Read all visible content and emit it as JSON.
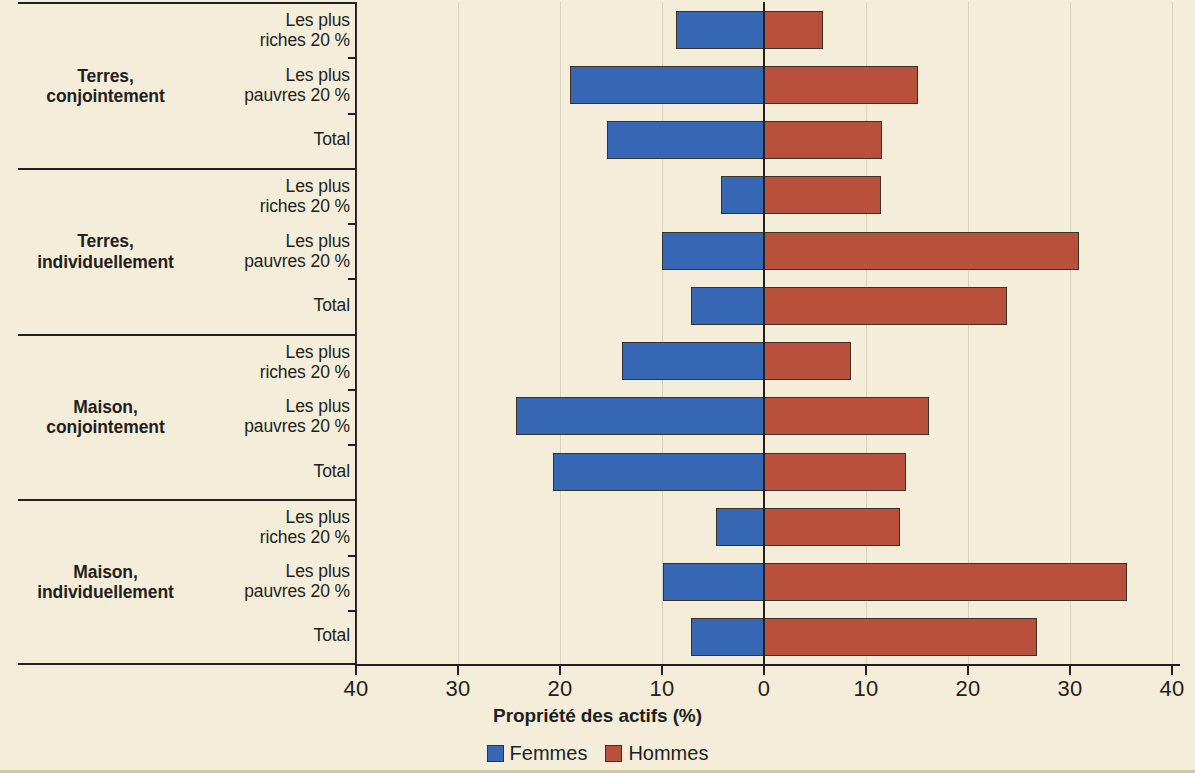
{
  "colors": {
    "female": "#3667b5",
    "male": "#b8503c",
    "background": "#f4edda",
    "ink": "#231f20"
  },
  "axis": {
    "title": "Propriété des actifs (%)",
    "tick_labels": [
      "40",
      "30",
      "20",
      "10",
      "0",
      "10",
      "20",
      "30",
      "40"
    ],
    "tick_values": [
      -40,
      -30,
      -20,
      -10,
      0,
      10,
      20,
      30,
      40
    ]
  },
  "legend": {
    "items": [
      {
        "label": "Femmes",
        "color": "#3667b5"
      },
      {
        "label": "Hommes",
        "color": "#b8503c"
      }
    ]
  },
  "groups": [
    {
      "title_line1": "Terres,",
      "title_line2": "conjointement",
      "rows": [
        {
          "line1": "Les plus",
          "line2": "riches 20 %"
        },
        {
          "line1": "Les plus",
          "line2": "pauvres 20 %"
        },
        {
          "line1": "Total",
          "line2": ""
        }
      ]
    },
    {
      "title_line1": "Terres,",
      "title_line2": "individuellement",
      "rows": [
        {
          "line1": "Les plus",
          "line2": "riches 20 %"
        },
        {
          "line1": "Les plus",
          "line2": "pauvres 20 %"
        },
        {
          "line1": "Total",
          "line2": ""
        }
      ]
    },
    {
      "title_line1": "Maison,",
      "title_line2": "conjointement",
      "rows": [
        {
          "line1": "Les plus",
          "line2": "riches 20 %"
        },
        {
          "line1": "Les plus",
          "line2": "pauvres 20 %"
        },
        {
          "line1": "Total",
          "line2": ""
        }
      ]
    },
    {
      "title_line1": "Maison,",
      "title_line2": "individuellement",
      "rows": [
        {
          "line1": "Les plus",
          "line2": "riches 20 %"
        },
        {
          "line1": "Les plus",
          "line2": "pauvres 20 %"
        },
        {
          "line1": "Total",
          "line2": ""
        }
      ]
    }
  ],
  "chart_data": {
    "type": "bar",
    "orientation": "horizontal",
    "style": "diverging butterfly / tornado",
    "title": "",
    "xlabel": "Propriété des actifs (%)",
    "ylabel": "",
    "xlim": [
      -40,
      40
    ],
    "xticks": [
      -40,
      -30,
      -20,
      -10,
      0,
      10,
      20,
      30,
      40
    ],
    "xticklabels": [
      "40",
      "30",
      "20",
      "10",
      "0",
      "10",
      "20",
      "30",
      "40"
    ],
    "grid": true,
    "legend_position": "bottom-center",
    "series": [
      {
        "name": "Femmes",
        "color": "#3667b5",
        "direction": "left"
      },
      {
        "name": "Hommes",
        "color": "#b8503c",
        "direction": "right"
      }
    ],
    "categories": [
      "Terres, conjointement — Les plus riches 20 %",
      "Terres, conjointement — Les plus pauvres 20 %",
      "Terres, conjointement — Total",
      "Terres, individuellement — Les plus riches 20 %",
      "Terres, individuellement — Les plus pauvres 20 %",
      "Terres, individuellement — Total",
      "Maison, conjointement — Les plus riches 20 %",
      "Maison, conjointement — Les plus pauvres 20 %",
      "Maison, conjointement — Total",
      "Maison, individuellement — Les plus riches 20 %",
      "Maison, individuellement — Les plus pauvres 20 %",
      "Maison, individuellement — Total"
    ],
    "values": {
      "Femmes": [
        8.6,
        19.0,
        15.4,
        4.2,
        10.0,
        7.2,
        13.9,
        24.3,
        20.7,
        4.7,
        9.9,
        7.2
      ],
      "Hommes": [
        5.8,
        15.1,
        11.6,
        11.5,
        30.9,
        23.8,
        8.5,
        16.2,
        13.9,
        13.3,
        35.6,
        26.8
      ]
    },
    "bars": [
      {
        "group": "Terres, conjointement",
        "row": "Les plus riches 20 %",
        "femmes": 8.6,
        "hommes": 5.8
      },
      {
        "group": "Terres, conjointement",
        "row": "Les plus pauvres 20 %",
        "femmes": 19.0,
        "hommes": 15.1
      },
      {
        "group": "Terres, conjointement",
        "row": "Total",
        "femmes": 15.4,
        "hommes": 11.6
      },
      {
        "group": "Terres, individuellement",
        "row": "Les plus riches 20 %",
        "femmes": 4.2,
        "hommes": 11.5
      },
      {
        "group": "Terres, individuellement",
        "row": "Les plus pauvres 20 %",
        "femmes": 10.0,
        "hommes": 30.9
      },
      {
        "group": "Terres, individuellement",
        "row": "Total",
        "femmes": 7.2,
        "hommes": 23.8
      },
      {
        "group": "Maison, conjointement",
        "row": "Les plus riches 20 %",
        "femmes": 13.9,
        "hommes": 8.5
      },
      {
        "group": "Maison, conjointement",
        "row": "Les plus pauvres 20 %",
        "femmes": 24.3,
        "hommes": 16.2
      },
      {
        "group": "Maison, conjointement",
        "row": "Total",
        "femmes": 20.7,
        "hommes": 13.9
      },
      {
        "group": "Maison, individuellement",
        "row": "Les plus riches 20 %",
        "femmes": 4.7,
        "hommes": 13.3
      },
      {
        "group": "Maison, individuellement",
        "row": "Les plus pauvres 20 %",
        "femmes": 9.9,
        "hommes": 35.6
      },
      {
        "group": "Maison, individuellement",
        "row": "Total",
        "femmes": 7.2,
        "hommes": 26.8
      }
    ]
  }
}
